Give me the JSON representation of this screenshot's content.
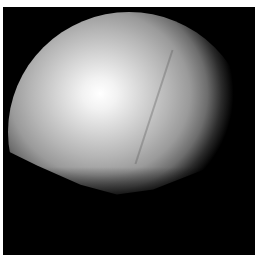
{
  "image": {
    "subject": "illuminated spherical body against black background",
    "colors": {
      "background": "#000000",
      "border": "#ffffff",
      "highlight": "#ffffff",
      "midtone": "#b5b5b5"
    }
  }
}
